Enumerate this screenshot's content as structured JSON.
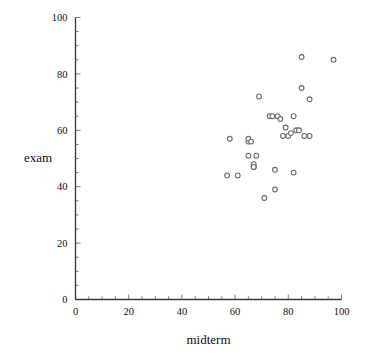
{
  "chart_data": {
    "type": "scatter",
    "title": "",
    "xlabel": "midterm",
    "ylabel": "exam",
    "xlim": [
      0,
      100
    ],
    "ylim": [
      0,
      100
    ],
    "xticks": [
      0,
      20,
      40,
      60,
      80,
      100
    ],
    "yticks": [
      0,
      20,
      40,
      60,
      80,
      100
    ],
    "xtick_labels": [
      "0",
      "20",
      "40",
      "60",
      "80",
      "100"
    ],
    "ytick_labels": [
      "0",
      "20",
      "40",
      "60",
      "80",
      "100"
    ],
    "x_minor_tick_step": 5,
    "y_minor_tick_step": 5,
    "grid": false,
    "legend": null,
    "marker": "open-circle",
    "marker_size_px": 3,
    "n_points": 33,
    "points": [
      {
        "x": 57,
        "y": 44
      },
      {
        "x": 58,
        "y": 57
      },
      {
        "x": 61,
        "y": 44
      },
      {
        "x": 65,
        "y": 51
      },
      {
        "x": 65,
        "y": 56
      },
      {
        "x": 65,
        "y": 57
      },
      {
        "x": 67,
        "y": 47
      },
      {
        "x": 67,
        "y": 48
      },
      {
        "x": 68,
        "y": 51
      },
      {
        "x": 69,
        "y": 72
      },
      {
        "x": 71,
        "y": 36
      },
      {
        "x": 73,
        "y": 65
      },
      {
        "x": 75,
        "y": 39
      },
      {
        "x": 75,
        "y": 46
      },
      {
        "x": 76,
        "y": 65
      },
      {
        "x": 77,
        "y": 64
      },
      {
        "x": 78,
        "y": 58
      },
      {
        "x": 79,
        "y": 61
      },
      {
        "x": 80,
        "y": 58
      },
      {
        "x": 81,
        "y": 59
      },
      {
        "x": 82,
        "y": 45
      },
      {
        "x": 82,
        "y": 65
      },
      {
        "x": 83,
        "y": 60
      },
      {
        "x": 85,
        "y": 86
      },
      {
        "x": 85,
        "y": 75
      },
      {
        "x": 86,
        "y": 58
      },
      {
        "x": 88,
        "y": 71
      },
      {
        "x": 88,
        "y": 58
      },
      {
        "x": 97,
        "y": 85
      },
      {
        "x": 66,
        "y": 56
      },
      {
        "x": 67,
        "y": 47
      },
      {
        "x": 74,
        "y": 65
      },
      {
        "x": 84,
        "y": 60
      }
    ]
  },
  "axes": {
    "x_axis_name": "midterm-axis",
    "y_axis_name": "exam-axis"
  }
}
